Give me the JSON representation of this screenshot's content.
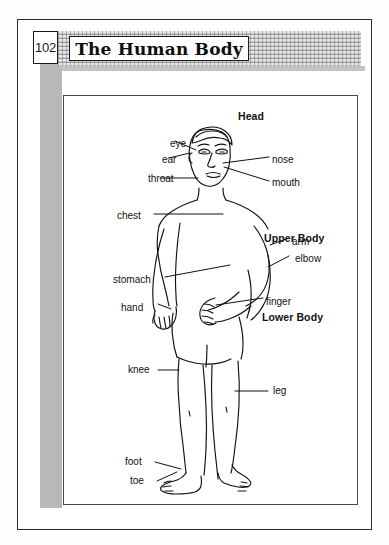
{
  "page": {
    "number": "102",
    "title": "The Human Body"
  },
  "diagram": {
    "section_headers": [
      {
        "label": "Head",
        "x": 238,
        "y": 110
      },
      {
        "label": "Upper Body",
        "x": 264,
        "y": 232
      },
      {
        "label": "Lower Body",
        "x": 262,
        "y": 311
      }
    ],
    "labels": [
      {
        "label": "eye",
        "x": 170,
        "y": 138,
        "align": "right"
      },
      {
        "label": "ear",
        "x": 162,
        "y": 154,
        "align": "right"
      },
      {
        "label": "throat",
        "x": 148,
        "y": 173,
        "align": "right"
      },
      {
        "label": "nose",
        "x": 256,
        "y": 154,
        "align": "left"
      },
      {
        "label": "mouth",
        "x": 256,
        "y": 177,
        "align": "left"
      },
      {
        "label": "chest",
        "x": 143,
        "y": 210,
        "align": "right"
      },
      {
        "label": "arm",
        "x": 284,
        "y": 236,
        "align": "left"
      },
      {
        "label": "elbow",
        "x": 287,
        "y": 253,
        "align": "left"
      },
      {
        "label": "stomach",
        "x": 152,
        "y": 274,
        "align": "right"
      },
      {
        "label": "finger",
        "x": 264,
        "y": 296,
        "align": "left"
      },
      {
        "label": "hand",
        "x": 145,
        "y": 302,
        "align": "right"
      },
      {
        "label": "knee",
        "x": 145,
        "y": 368,
        "align": "right"
      },
      {
        "label": "leg",
        "x": 267,
        "y": 389,
        "align": "left"
      },
      {
        "label": "foot",
        "x": 142,
        "y": 459,
        "align": "right"
      },
      {
        "label": "toe",
        "x": 143,
        "y": 479,
        "align": "right"
      }
    ]
  },
  "colors": {
    "ink": "#111111",
    "frame": "#2b2b2b",
    "sidebar_gray": "#b8b8b8",
    "halftone": "#e9e9e9",
    "paper": "#ffffff"
  }
}
